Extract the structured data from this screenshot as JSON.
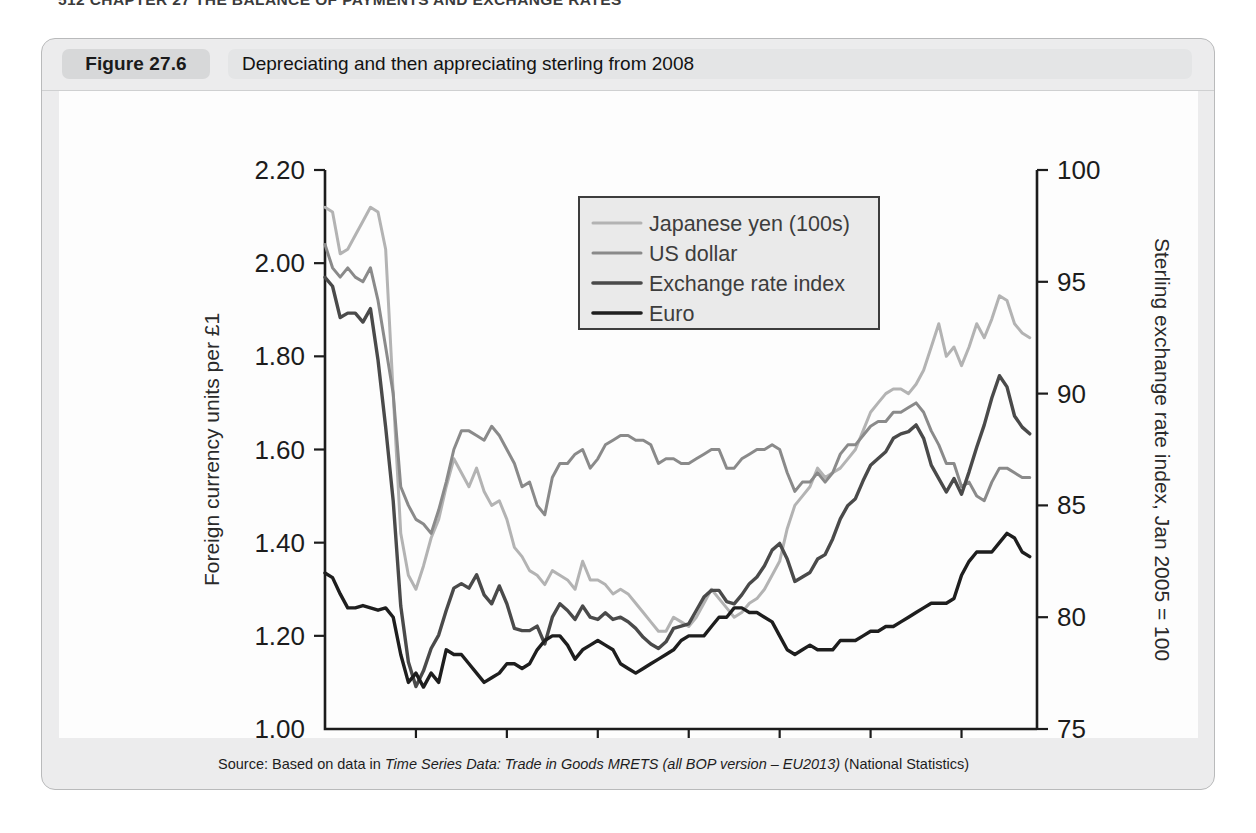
{
  "running_head": "512  CHAPTER 27  THE BALANCE OF PAYMENTS AND EXCHANGE RATES",
  "figure": {
    "tag": "Figure 27.6",
    "title": "Depreciating and then appreciating sterling from 2008",
    "source_prefix": "Source: Based on data in ",
    "source_italic": "Time Series Data: Trade in Goods MRETS (all BOP version – EU2013)",
    "source_suffix": " (National Statistics)"
  },
  "chart_data": {
    "type": "line",
    "title": "Depreciating and then appreciating sterling from 2008",
    "xlabel": "",
    "ylabel": "Foreign currency units per £1",
    "y2label": "Sterling exchange rate index, Jan 2005 = 100",
    "xlim": [
      2008,
      2015.83
    ],
    "ylim": [
      1.0,
      2.2
    ],
    "y2lim": [
      75,
      100
    ],
    "yticks": [
      "1.00",
      "1.20",
      "1.40",
      "1.60",
      "1.80",
      "2.00",
      "2.20"
    ],
    "ytick_values": [
      1.0,
      1.2,
      1.4,
      1.6,
      1.8,
      2.0,
      2.2
    ],
    "y2ticks": [
      "75",
      "80",
      "85",
      "90",
      "95",
      "100"
    ],
    "y2tick_values": [
      75,
      80,
      85,
      90,
      95,
      100
    ],
    "xticks": [
      "2008",
      "2009",
      "2010",
      "2011",
      "2012",
      "2013",
      "2014",
      "2015"
    ],
    "xtick_values": [
      2008,
      2009,
      2010,
      2011,
      2012,
      2013,
      2014,
      2015
    ],
    "grid": false,
    "legend_position": "top-center",
    "colors": {
      "japanese_yen": "#b3b3b3",
      "us_dollar": "#8a8a8a",
      "exchange_rate_index": "#4a4a4a",
      "euro": "#1e1e1e"
    },
    "series": [
      {
        "name": "Japanese yen (100s)",
        "axis": "left",
        "color": "#b3b3b3",
        "x": [
          2008.0,
          2008.083,
          2008.167,
          2008.25,
          2008.333,
          2008.417,
          2008.5,
          2008.583,
          2008.667,
          2008.75,
          2008.833,
          2008.917,
          2009.0,
          2009.083,
          2009.167,
          2009.25,
          2009.333,
          2009.417,
          2009.5,
          2009.583,
          2009.667,
          2009.75,
          2009.833,
          2009.917,
          2010.0,
          2010.083,
          2010.167,
          2010.25,
          2010.333,
          2010.417,
          2010.5,
          2010.583,
          2010.667,
          2010.75,
          2010.833,
          2010.917,
          2011.0,
          2011.083,
          2011.167,
          2011.25,
          2011.333,
          2011.417,
          2011.5,
          2011.583,
          2011.667,
          2011.75,
          2011.833,
          2011.917,
          2012.0,
          2012.083,
          2012.167,
          2012.25,
          2012.333,
          2012.417,
          2012.5,
          2012.583,
          2012.667,
          2012.75,
          2012.833,
          2012.917,
          2013.0,
          2013.083,
          2013.167,
          2013.25,
          2013.333,
          2013.417,
          2013.5,
          2013.583,
          2013.667,
          2013.75,
          2013.833,
          2013.917,
          2014.0,
          2014.083,
          2014.167,
          2014.25,
          2014.333,
          2014.417,
          2014.5,
          2014.583,
          2014.667,
          2014.75,
          2014.833,
          2014.917,
          2015.0,
          2015.083,
          2015.167,
          2015.25,
          2015.333,
          2015.417,
          2015.5,
          2015.583,
          2015.667,
          2015.75
        ],
        "values": [
          2.12,
          2.11,
          2.02,
          2.03,
          2.06,
          2.09,
          2.12,
          2.11,
          2.03,
          1.72,
          1.42,
          1.33,
          1.3,
          1.35,
          1.41,
          1.45,
          1.52,
          1.58,
          1.55,
          1.52,
          1.56,
          1.51,
          1.48,
          1.49,
          1.45,
          1.39,
          1.37,
          1.34,
          1.33,
          1.31,
          1.34,
          1.33,
          1.32,
          1.3,
          1.36,
          1.32,
          1.32,
          1.31,
          1.29,
          1.3,
          1.29,
          1.27,
          1.25,
          1.23,
          1.21,
          1.21,
          1.24,
          1.23,
          1.22,
          1.24,
          1.27,
          1.3,
          1.28,
          1.26,
          1.24,
          1.25,
          1.27,
          1.28,
          1.3,
          1.33,
          1.36,
          1.43,
          1.48,
          1.5,
          1.52,
          1.56,
          1.54,
          1.55,
          1.56,
          1.58,
          1.6,
          1.64,
          1.68,
          1.7,
          1.72,
          1.73,
          1.73,
          1.72,
          1.74,
          1.77,
          1.82,
          1.87,
          1.8,
          1.82,
          1.78,
          1.82,
          1.87,
          1.84,
          1.88,
          1.93,
          1.92,
          1.87,
          1.85,
          1.84
        ]
      },
      {
        "name": "US dollar",
        "axis": "left",
        "color": "#8a8a8a",
        "x": [
          2008.0,
          2008.083,
          2008.167,
          2008.25,
          2008.333,
          2008.417,
          2008.5,
          2008.583,
          2008.667,
          2008.75,
          2008.833,
          2008.917,
          2009.0,
          2009.083,
          2009.167,
          2009.25,
          2009.333,
          2009.417,
          2009.5,
          2009.583,
          2009.667,
          2009.75,
          2009.833,
          2009.917,
          2010.0,
          2010.083,
          2010.167,
          2010.25,
          2010.333,
          2010.417,
          2010.5,
          2010.583,
          2010.667,
          2010.75,
          2010.833,
          2010.917,
          2011.0,
          2011.083,
          2011.167,
          2011.25,
          2011.333,
          2011.417,
          2011.5,
          2011.583,
          2011.667,
          2011.75,
          2011.833,
          2011.917,
          2012.0,
          2012.083,
          2012.167,
          2012.25,
          2012.333,
          2012.417,
          2012.5,
          2012.583,
          2012.667,
          2012.75,
          2012.833,
          2012.917,
          2013.0,
          2013.083,
          2013.167,
          2013.25,
          2013.333,
          2013.417,
          2013.5,
          2013.583,
          2013.667,
          2013.75,
          2013.833,
          2013.917,
          2014.0,
          2014.083,
          2014.167,
          2014.25,
          2014.333,
          2014.417,
          2014.5,
          2014.583,
          2014.667,
          2014.75,
          2014.833,
          2014.917,
          2015.0,
          2015.083,
          2015.167,
          2015.25,
          2015.333,
          2015.417,
          2015.5,
          2015.583,
          2015.667,
          2015.75
        ],
        "values": [
          2.04,
          1.99,
          1.97,
          1.99,
          1.97,
          1.96,
          1.99,
          1.92,
          1.82,
          1.72,
          1.52,
          1.48,
          1.45,
          1.44,
          1.42,
          1.47,
          1.53,
          1.6,
          1.64,
          1.64,
          1.63,
          1.62,
          1.65,
          1.63,
          1.6,
          1.57,
          1.52,
          1.53,
          1.48,
          1.46,
          1.54,
          1.57,
          1.57,
          1.59,
          1.6,
          1.56,
          1.58,
          1.61,
          1.62,
          1.63,
          1.63,
          1.62,
          1.62,
          1.61,
          1.57,
          1.58,
          1.58,
          1.57,
          1.57,
          1.58,
          1.59,
          1.6,
          1.6,
          1.56,
          1.56,
          1.58,
          1.59,
          1.6,
          1.6,
          1.61,
          1.6,
          1.55,
          1.51,
          1.53,
          1.53,
          1.55,
          1.53,
          1.55,
          1.59,
          1.61,
          1.61,
          1.63,
          1.65,
          1.66,
          1.66,
          1.68,
          1.68,
          1.69,
          1.7,
          1.68,
          1.64,
          1.61,
          1.57,
          1.57,
          1.52,
          1.53,
          1.5,
          1.49,
          1.53,
          1.56,
          1.56,
          1.55,
          1.54,
          1.54
        ]
      },
      {
        "name": "Exchange rate index",
        "axis": "right",
        "color": "#4a4a4a",
        "x": [
          2008.0,
          2008.083,
          2008.167,
          2008.25,
          2008.333,
          2008.417,
          2008.5,
          2008.583,
          2008.667,
          2008.75,
          2008.833,
          2008.917,
          2009.0,
          2009.083,
          2009.167,
          2009.25,
          2009.333,
          2009.417,
          2009.5,
          2009.583,
          2009.667,
          2009.75,
          2009.833,
          2009.917,
          2010.0,
          2010.083,
          2010.167,
          2010.25,
          2010.333,
          2010.417,
          2010.5,
          2010.583,
          2010.667,
          2010.75,
          2010.833,
          2010.917,
          2011.0,
          2011.083,
          2011.167,
          2011.25,
          2011.333,
          2011.417,
          2011.5,
          2011.583,
          2011.667,
          2011.75,
          2011.833,
          2011.917,
          2012.0,
          2012.083,
          2012.167,
          2012.25,
          2012.333,
          2012.417,
          2012.5,
          2012.583,
          2012.667,
          2012.75,
          2012.833,
          2012.917,
          2013.0,
          2013.083,
          2013.167,
          2013.25,
          2013.333,
          2013.417,
          2013.5,
          2013.583,
          2013.667,
          2013.75,
          2013.833,
          2013.917,
          2014.0,
          2014.083,
          2014.167,
          2014.25,
          2014.333,
          2014.417,
          2014.5,
          2014.583,
          2014.667,
          2014.75,
          2014.833,
          2014.917,
          2015.0,
          2015.083,
          2015.167,
          2015.25,
          2015.333,
          2015.417,
          2015.5,
          2015.583,
          2015.667,
          2015.75
        ],
        "values": [
          95.2,
          94.8,
          93.4,
          93.6,
          93.6,
          93.2,
          93.8,
          91.5,
          88.5,
          85.2,
          80.5,
          78.0,
          76.9,
          77.6,
          78.6,
          79.2,
          80.3,
          81.3,
          81.5,
          81.3,
          81.9,
          81.0,
          80.6,
          81.4,
          80.6,
          79.5,
          79.4,
          79.4,
          79.6,
          78.8,
          80.0,
          80.6,
          80.3,
          79.9,
          80.5,
          80.0,
          79.9,
          80.2,
          79.9,
          80.0,
          79.8,
          79.5,
          79.1,
          78.8,
          78.6,
          78.9,
          79.5,
          79.6,
          79.7,
          80.3,
          80.9,
          81.2,
          81.2,
          80.7,
          80.6,
          81.0,
          81.5,
          81.8,
          82.3,
          83.0,
          83.3,
          82.6,
          81.6,
          81.8,
          82.0,
          82.6,
          82.8,
          83.5,
          84.4,
          85.0,
          85.3,
          86.1,
          86.8,
          87.1,
          87.4,
          88.0,
          88.2,
          88.3,
          88.6,
          88.0,
          86.8,
          86.2,
          85.6,
          86.2,
          85.5,
          86.5,
          87.6,
          88.6,
          89.8,
          90.8,
          90.3,
          89.0,
          88.5,
          88.2
        ]
      },
      {
        "name": "Euro",
        "axis": "left",
        "color": "#1e1e1e",
        "x": [
          2008.0,
          2008.083,
          2008.167,
          2008.25,
          2008.333,
          2008.417,
          2008.5,
          2008.583,
          2008.667,
          2008.75,
          2008.833,
          2008.917,
          2009.0,
          2009.083,
          2009.167,
          2009.25,
          2009.333,
          2009.417,
          2009.5,
          2009.583,
          2009.667,
          2009.75,
          2009.833,
          2009.917,
          2010.0,
          2010.083,
          2010.167,
          2010.25,
          2010.333,
          2010.417,
          2010.5,
          2010.583,
          2010.667,
          2010.75,
          2010.833,
          2010.917,
          2011.0,
          2011.083,
          2011.167,
          2011.25,
          2011.333,
          2011.417,
          2011.5,
          2011.583,
          2011.667,
          2011.75,
          2011.833,
          2011.917,
          2012.0,
          2012.083,
          2012.167,
          2012.25,
          2012.333,
          2012.417,
          2012.5,
          2012.583,
          2012.667,
          2012.75,
          2012.833,
          2012.917,
          2013.0,
          2013.083,
          2013.167,
          2013.25,
          2013.333,
          2013.417,
          2013.5,
          2013.583,
          2013.667,
          2013.75,
          2013.833,
          2013.917,
          2014.0,
          2014.083,
          2014.167,
          2014.25,
          2014.333,
          2014.417,
          2014.5,
          2014.583,
          2014.667,
          2014.75,
          2014.833,
          2014.917,
          2015.0,
          2015.083,
          2015.167,
          2015.25,
          2015.333,
          2015.417,
          2015.5,
          2015.583,
          2015.667,
          2015.75
        ],
        "values": [
          1.335,
          1.325,
          1.29,
          1.26,
          1.26,
          1.265,
          1.26,
          1.255,
          1.26,
          1.24,
          1.16,
          1.1,
          1.12,
          1.09,
          1.12,
          1.1,
          1.17,
          1.16,
          1.16,
          1.14,
          1.12,
          1.1,
          1.11,
          1.12,
          1.14,
          1.14,
          1.13,
          1.14,
          1.17,
          1.19,
          1.2,
          1.2,
          1.18,
          1.15,
          1.17,
          1.18,
          1.19,
          1.18,
          1.17,
          1.14,
          1.13,
          1.12,
          1.13,
          1.14,
          1.15,
          1.16,
          1.17,
          1.19,
          1.2,
          1.2,
          1.2,
          1.22,
          1.24,
          1.24,
          1.26,
          1.26,
          1.25,
          1.25,
          1.24,
          1.23,
          1.2,
          1.17,
          1.16,
          1.17,
          1.18,
          1.17,
          1.17,
          1.17,
          1.19,
          1.19,
          1.19,
          1.2,
          1.21,
          1.21,
          1.22,
          1.22,
          1.23,
          1.24,
          1.25,
          1.26,
          1.27,
          1.27,
          1.27,
          1.28,
          1.33,
          1.36,
          1.38,
          1.38,
          1.38,
          1.4,
          1.42,
          1.41,
          1.38,
          1.37
        ]
      }
    ]
  },
  "legend": {
    "items": [
      {
        "label": "Japanese yen (100s)",
        "color": "#b3b3b3"
      },
      {
        "label": "US dollar",
        "color": "#8a8a8a"
      },
      {
        "label": "Exchange rate index",
        "color": "#4a4a4a"
      },
      {
        "label": "Euro",
        "color": "#1e1e1e"
      }
    ]
  }
}
